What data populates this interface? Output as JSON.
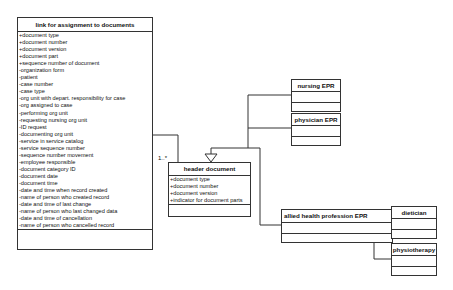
{
  "diagram": {
    "classes": {
      "link": {
        "title": "link for assignment to documents",
        "attributes": [
          "+document type",
          "+document number",
          "+document version",
          "+document part",
          "+sequence number of document",
          "-organization form",
          "-patient",
          "-case number",
          "-case type",
          "-org unit with depart. responsibility for case",
          "-org assigned to case",
          "-performing org unit",
          "-requesting nursing org unit",
          "-ID request",
          "-documenting org unit",
          "-service in service catalog",
          "-service sequence number",
          "-sequence number movement",
          "-employee responsible",
          "-document category ID",
          "-document date",
          "-document time",
          "-date and time when record created",
          "-name of person who created record",
          "-date and time of last change",
          "-name of person who last changed data",
          "-date and time of cancellation",
          "-name of person who cancelled record"
        ]
      },
      "header": {
        "title": "header document",
        "attributes": [
          "+document type",
          "+document number",
          "+document version",
          "+indicator for document parts"
        ]
      },
      "nursing": {
        "title": "nursing EPR"
      },
      "physician": {
        "title": "physician EPR"
      },
      "allied": {
        "title": "allied health profession EPR"
      },
      "dietician": {
        "title": "dietician"
      },
      "physiotherapy": {
        "title": "physiotherapy"
      }
    },
    "associations": [
      {
        "from": "link for assignment to documents",
        "to": "header document",
        "from_mult": "1",
        "to_mult": "1..*"
      }
    ],
    "generalizations": [
      {
        "child": "nursing EPR",
        "parent": "header document"
      },
      {
        "child": "physician EPR",
        "parent": "header document"
      },
      {
        "child": "allied health profession EPR",
        "parent": "header document"
      },
      {
        "child": "dietician",
        "parent": "allied health profession EPR"
      },
      {
        "child": "physiotherapy",
        "parent": "allied health profession EPR"
      }
    ],
    "multiplicity": {
      "one": "1",
      "many": "1..*"
    }
  }
}
